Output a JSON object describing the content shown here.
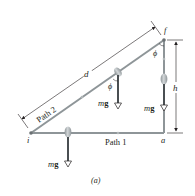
{
  "figure": {
    "caption": "(a)",
    "points": {
      "initial": "i",
      "final": "f",
      "corner": "a"
    },
    "paths": {
      "path1_label": "Path 1",
      "path2_label": "Path 2"
    },
    "dimensions": {
      "hypotenuse_label": "d",
      "height_label": "h"
    },
    "angles": {
      "phi_label": "ϕ"
    },
    "forces": {
      "weight_label_m": "m",
      "weight_label_g": "g"
    },
    "colors": {
      "path_line": "#8e9598",
      "weight_arrow": "#4a4f52",
      "ball": "#b9bfc1",
      "dimension_line": "#231f20",
      "text": "#231f20"
    }
  }
}
